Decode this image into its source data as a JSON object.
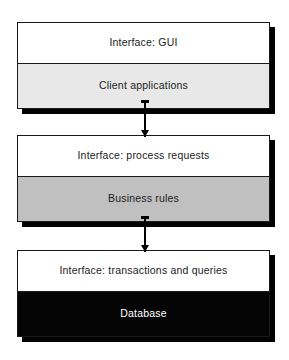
{
  "diagram": {
    "type": "layered-block-diagram",
    "background_color": "#ffffff",
    "tiers": [
      {
        "id": "client",
        "interface_label": "Interface: GUI",
        "body_label": "Client applications",
        "body_fill": "#e8e8e8",
        "interface_fill": "#ffffff",
        "body_text_color": "#1c1c1c"
      },
      {
        "id": "business",
        "interface_label": "Interface: process requests",
        "body_label": "Business rules",
        "body_fill": "#c0c0c0",
        "interface_fill": "#ffffff",
        "body_text_color": "#1c1c1c"
      },
      {
        "id": "database",
        "interface_label": "Interface: transactions and queries",
        "body_label": "Database",
        "body_fill": "#050505",
        "interface_fill": "#ffffff",
        "body_text_color": "#ffffff"
      }
    ],
    "connectors": [
      {
        "id": "client-to-business",
        "from": "client",
        "to": "business",
        "direction": "down",
        "style": "solid-arrow"
      },
      {
        "id": "business-to-database",
        "from": "business",
        "to": "database",
        "direction": "down",
        "style": "solid-arrow"
      }
    ],
    "shadow_color": "#000000",
    "border_color": "#1a1a1a"
  }
}
